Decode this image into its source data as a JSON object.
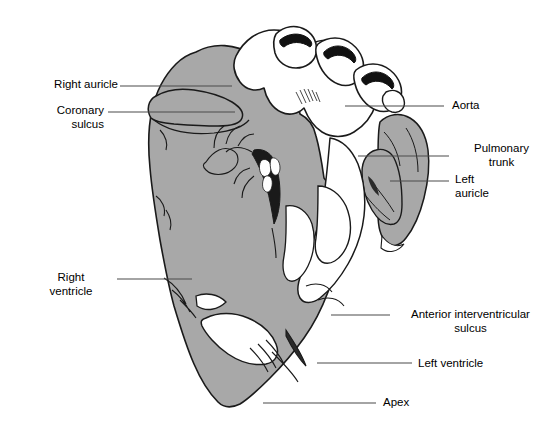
{
  "figure": {
    "background_color": "#ffffff",
    "muscle_fill": "#a8a8a8",
    "fat_fill": "#ffffff",
    "vessel_lumen": "#111111",
    "outline_color": "#1a1a1a",
    "leader_color": "#4a4a4a"
  },
  "labels": [
    {
      "id": "right-auricle",
      "text": "Right auricle",
      "align": "right",
      "x": 30,
      "y": 78,
      "line": {
        "x1": 120,
        "y1": 86,
        "x2": 232,
        "y2": 86
      }
    },
    {
      "id": "coronary-sulcus",
      "text": "Coronary\nsulcus",
      "align": "right",
      "x": 22,
      "y": 104,
      "line": {
        "x1": 108,
        "y1": 112,
        "x2": 235,
        "y2": 112
      }
    },
    {
      "id": "aorta",
      "text": "Aorta",
      "align": "left",
      "x": 452,
      "y": 99,
      "line": {
        "x1": 345,
        "y1": 106,
        "x2": 444,
        "y2": 106
      }
    },
    {
      "id": "pulmonary-trunk",
      "text": "Pulmonary\ntrunk",
      "align": "left",
      "x": 456,
      "y": 142,
      "line": {
        "x1": 358,
        "y1": 156,
        "x2": 449,
        "y2": 156
      }
    },
    {
      "id": "left-auricle",
      "text": "Left\nauricle",
      "align": "left",
      "x": 456,
      "y": 173,
      "line": {
        "x1": 390,
        "y1": 181,
        "x2": 449,
        "y2": 181
      }
    },
    {
      "id": "right-ventricle",
      "text": "Right\nventricle",
      "align": "right",
      "x": 38,
      "y": 271,
      "line": {
        "x1": 117,
        "y1": 279,
        "x2": 192,
        "y2": 279
      }
    },
    {
      "id": "anterior-interventricular-sulcus",
      "text": "Anterior interventricular\nsulcus",
      "align": "left",
      "x": 396,
      "y": 309,
      "line": {
        "x1": 331,
        "y1": 315,
        "x2": 390,
        "y2": 315
      }
    },
    {
      "id": "left-ventricle",
      "text": "Left ventricle",
      "align": "left",
      "x": 418,
      "y": 357,
      "line": {
        "x1": 317,
        "y1": 363,
        "x2": 412,
        "y2": 363
      }
    },
    {
      "id": "apex",
      "text": "Apex",
      "align": "left",
      "x": 383,
      "y": 396,
      "line": {
        "x1": 263,
        "y1": 403,
        "x2": 376,
        "y2": 403
      }
    }
  ]
}
